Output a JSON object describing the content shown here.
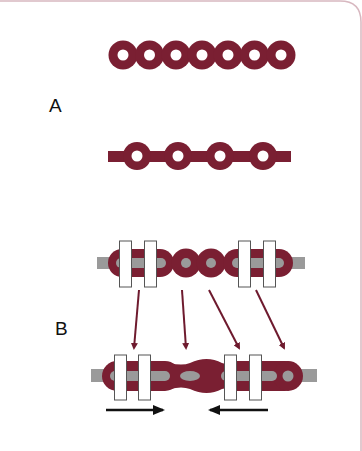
{
  "figure": {
    "panels": [
      {
        "label": "A",
        "description": "Closed elastomeric chain (top) and open/spaced elastomeric chain (bottom)"
      },
      {
        "label": "B",
        "description": "Elastomeric chain on archwire between brackets before and after space closure; arrows indicate forces toward each other"
      }
    ],
    "colors": {
      "chain": "#7a1f32",
      "wire": "#9a9a9a",
      "bracket_fill": "#ffffff",
      "bracket_stroke": "#555555",
      "arrow_red": "#6e1a2e",
      "arrow_black": "#111111",
      "frame_border": "#c9a0aa"
    },
    "panelA": {
      "closed_chain_rings": 7,
      "open_chain_rings": 4
    },
    "panelB": {
      "top_chain_bracket_pairs": 2,
      "connection_arrows": 4,
      "force_arrows": [
        "right",
        "left"
      ]
    }
  }
}
